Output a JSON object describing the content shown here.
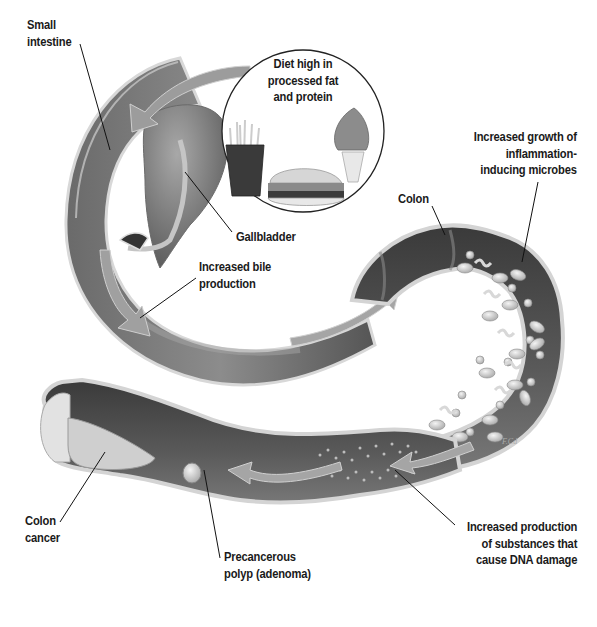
{
  "figure": {
    "type": "anatomical-illustration",
    "palette": {
      "background": "#ffffff",
      "tissue_dark": "#4a4a4a",
      "tissue_mid": "#7a7a7a",
      "tissue_light": "#b8b8b8",
      "wall_edge": "#d4d4d4",
      "arrow": "#9a9a9a",
      "label_text": "#1a1a1a",
      "leader_line": "#111111"
    }
  },
  "labels": {
    "small_intestine": [
      "Small",
      "intestine"
    ],
    "diet": [
      "Diet high in",
      "processed fat",
      "and protein"
    ],
    "gallbladder": [
      "Gallbladder"
    ],
    "bile": [
      "Increased bile",
      "production"
    ],
    "colon": [
      "Colon"
    ],
    "microbes": [
      "Increased growth of",
      "inflammation-",
      "inducing microbes"
    ],
    "colon_cancer": [
      "Colon",
      "cancer"
    ],
    "polyp": [
      "Precancerous",
      "polyp (adenoma)"
    ],
    "dna_damage": [
      "Increased production",
      "of substances that",
      "cause DNA damage"
    ]
  },
  "inset": {
    "items": [
      "french-fries",
      "hamburger",
      "ice-cream-cone"
    ]
  },
  "signature": "F.Cd",
  "caption": ""
}
